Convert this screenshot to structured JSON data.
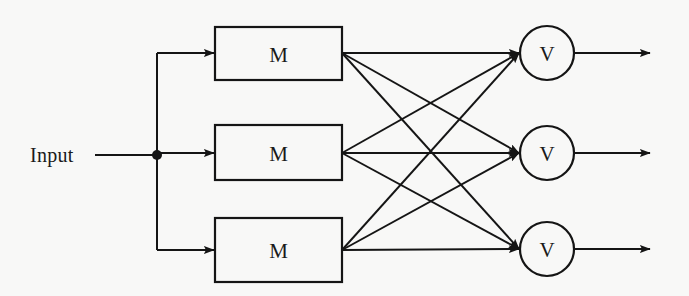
{
  "diagram": {
    "background_color": "#f8f8f7",
    "stroke_color": "#151515",
    "input": {
      "label": "Input",
      "label_x": 30,
      "label_y": 155,
      "line_start_x": 95,
      "line_end_x": 157,
      "line_y": 155,
      "junction_x": 157,
      "junction_y": 155,
      "junction_radius": 5
    },
    "bus": {
      "x": 157,
      "y_top": 53,
      "y_bottom": 250
    },
    "m_blocks": {
      "label": "M",
      "x_left": 215,
      "x_right": 342,
      "width": 127,
      "rows": [
        {
          "name": "m-block-top",
          "y_top": 27,
          "y_bottom": 80,
          "center_y": 53
        },
        {
          "name": "m-block-middle",
          "y_top": 125,
          "y_bottom": 180,
          "center_y": 153
        },
        {
          "name": "m-block-bottom",
          "y_top": 218,
          "y_bottom": 282,
          "center_y": 250
        }
      ]
    },
    "v_nodes": {
      "label": "V",
      "center_x": 547,
      "radius": 27,
      "rows": [
        {
          "name": "v-node-top",
          "center_y": 53
        },
        {
          "name": "v-node-middle",
          "center_y": 153
        },
        {
          "name": "v-node-bottom",
          "center_y": 249
        }
      ]
    },
    "outputs": {
      "line_start_x": 574,
      "line_end_x": 650,
      "rows": [
        {
          "name": "output-arrow-top",
          "y": 53
        },
        {
          "name": "output-arrow-middle",
          "y": 153
        },
        {
          "name": "output-arrow-bottom",
          "y": 249
        }
      ]
    },
    "mesh": {
      "description": "fully connected: each M block output connects to all three V nodes",
      "source_x": 342,
      "target_x": 519,
      "connections": [
        {
          "name": "mesh-m1-to-v1",
          "from_row": 0,
          "to_row": 0,
          "y1": 53,
          "y2": 53
        },
        {
          "name": "mesh-m1-to-v2",
          "from_row": 0,
          "to_row": 1,
          "y1": 53,
          "y2": 153
        },
        {
          "name": "mesh-m1-to-v3",
          "from_row": 0,
          "to_row": 2,
          "y1": 53,
          "y2": 249
        },
        {
          "name": "mesh-m2-to-v1",
          "from_row": 1,
          "to_row": 0,
          "y1": 153,
          "y2": 53
        },
        {
          "name": "mesh-m2-to-v2",
          "from_row": 1,
          "to_row": 1,
          "y1": 153,
          "y2": 153
        },
        {
          "name": "mesh-m2-to-v3",
          "from_row": 1,
          "to_row": 2,
          "y1": 153,
          "y2": 249
        },
        {
          "name": "mesh-m3-to-v1",
          "from_row": 2,
          "to_row": 0,
          "y1": 250,
          "y2": 53
        },
        {
          "name": "mesh-m3-to-v2",
          "from_row": 2,
          "to_row": 1,
          "y1": 250,
          "y2": 153
        },
        {
          "name": "mesh-m3-to-v3",
          "from_row": 2,
          "to_row": 2,
          "y1": 250,
          "y2": 249
        }
      ]
    },
    "branch_arrows": [
      {
        "name": "branch-arrow-top",
        "y": 53
      },
      {
        "name": "branch-arrow-middle",
        "y": 155
      },
      {
        "name": "branch-arrow-bottom",
        "y": 250
      }
    ]
  }
}
